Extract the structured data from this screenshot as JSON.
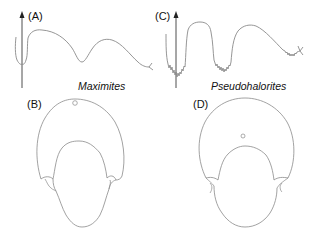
{
  "figure": {
    "panels": [
      {
        "id": "A",
        "label": "(A)",
        "kind": "suture-line"
      },
      {
        "id": "B",
        "label": "(B)",
        "kind": "whorl-cross-section"
      },
      {
        "id": "C",
        "label": "(C)",
        "kind": "suture-line"
      },
      {
        "id": "D",
        "label": "(D)",
        "kind": "whorl-cross-section"
      }
    ],
    "taxa": [
      {
        "name": "Maximites",
        "panels": [
          "A",
          "B"
        ]
      },
      {
        "name": "Pseudohalorites",
        "panels": [
          "C",
          "D"
        ]
      }
    ],
    "colors": {
      "line": "#8a8a8a",
      "axis": "#222222",
      "text": "#111111",
      "background": "#ffffff"
    }
  }
}
